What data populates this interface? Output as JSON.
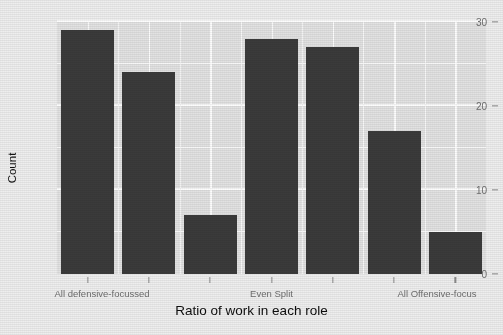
{
  "chart_data": {
    "type": "bar",
    "title": "",
    "xlabel": "Ratio of work in each role",
    "ylabel": "Count",
    "categories": [
      "1",
      "2",
      "3",
      "4",
      "5",
      "6",
      "7"
    ],
    "values": [
      29,
      24,
      7,
      28,
      27,
      17,
      5
    ],
    "ylim": [
      0,
      30
    ],
    "yticks": [
      0,
      10,
      20,
      30
    ],
    "ytick_labels": [
      "0",
      "10",
      "20",
      "30"
    ],
    "xtick_labels": [
      "All defensive-focussed",
      "",
      "",
      "Even Split",
      "",
      "",
      "All Offensive-focus"
    ],
    "xtick_visible_labels": [
      {
        "index": 0,
        "text": "All defensive-focussed"
      },
      {
        "index": 3,
        "text": "Even Split"
      },
      {
        "index": 6,
        "text": "All Offensive-focus"
      }
    ],
    "grid": true,
    "legend": "none",
    "bar_color": "#3b3b3b",
    "panel_color": "#e2e2e2",
    "grid_color": "#f7f7f7",
    "plot_background": "#eeeeee"
  },
  "axis": {
    "y_label": "Count",
    "x_label": "Ratio of work in each role",
    "y_tick_0": "0",
    "y_tick_1": "10",
    "y_tick_2": "20",
    "y_tick_3": "30",
    "x_tick_left": "All defensive-focussed",
    "x_tick_center": "Even Split",
    "x_tick_right": "All Offensive-focus"
  }
}
